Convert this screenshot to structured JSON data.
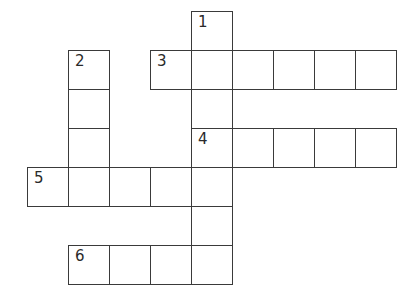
{
  "puzzle": {
    "type": "crossword",
    "grid_origin": {
      "x": 27,
      "y": 11
    },
    "cell_pitch": {
      "x": 41,
      "y": 39
    },
    "line_color": "#3a3a3a",
    "background": "#ffffff",
    "entries": [
      {
        "number": "1",
        "direction": "down",
        "row": 0,
        "col": 4,
        "length": 7
      },
      {
        "number": "2",
        "direction": "down",
        "row": 1,
        "col": 1,
        "length": 4
      },
      {
        "number": "3",
        "direction": "across",
        "row": 1,
        "col": 3,
        "length": 6
      },
      {
        "number": "4",
        "direction": "across",
        "row": 3,
        "col": 4,
        "length": 5
      },
      {
        "number": "5",
        "direction": "across",
        "row": 4,
        "col": 0,
        "length": 5
      },
      {
        "number": "6",
        "direction": "across",
        "row": 6,
        "col": 1,
        "length": 4
      }
    ]
  }
}
